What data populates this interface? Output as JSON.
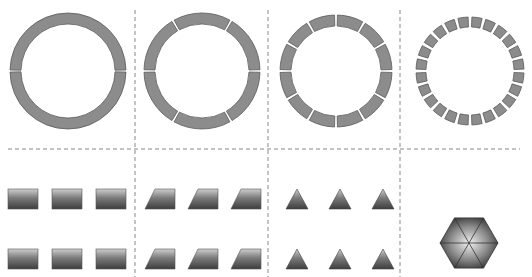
{
  "figure": {
    "colors": {
      "segment_fill": "#8c8c8c",
      "segment_stroke": "#5a5a5a",
      "divider": "#888888",
      "tile_top": "#c8c8c8",
      "tile_bottom": "#4a4a4a",
      "hex_center": "#eeeeee",
      "hex_edge": "#3a3a3a"
    },
    "rings": [
      {
        "name": "ring-2-segments",
        "segments": 2,
        "cx": 68,
        "cy": 71,
        "r_outer": 58,
        "r_inner": 47,
        "gap_deg": 2.0,
        "offset_deg": 0
      },
      {
        "name": "ring-6-segments",
        "segments": 6,
        "cx": 202,
        "cy": 71,
        "r_outer": 58,
        "r_inner": 47,
        "gap_deg": 2.5,
        "offset_deg": 0
      },
      {
        "name": "ring-12-segments",
        "segments": 12,
        "cx": 336,
        "cy": 71,
        "r_outer": 56,
        "r_inner": 45,
        "gap_deg": 3.0,
        "offset_deg": 0
      },
      {
        "name": "ring-24-segments",
        "segments": 24,
        "cx": 470,
        "cy": 71,
        "r_outer": 54,
        "r_inner": 44,
        "gap_deg": 4.0,
        "offset_deg": 0
      }
    ],
    "tiles": {
      "rectangles": {
        "xs": [
          8,
          52,
          96
        ],
        "ys": [
          189,
          249
        ],
        "w": 30,
        "h": 20
      },
      "trapezoids": {
        "xs": [
          145,
          188,
          231
        ],
        "ys": [
          189,
          249
        ],
        "w": 30,
        "h": 20,
        "slant": 10
      },
      "triangles": {
        "xs": [
          286,
          329,
          372
        ],
        "ys": [
          189,
          249
        ],
        "w": 22,
        "h": 20
      },
      "hexagon": {
        "cx": 469,
        "cy": 243,
        "r": 29
      }
    },
    "dividers": {
      "horizontal": {
        "y": 149,
        "x1": 8,
        "x2": 520
      },
      "vertical": [
        {
          "x": 135,
          "y1": 10,
          "y2": 277
        },
        {
          "x": 268,
          "y1": 10,
          "y2": 277
        },
        {
          "x": 400,
          "y1": 10,
          "y2": 277
        }
      ]
    }
  }
}
